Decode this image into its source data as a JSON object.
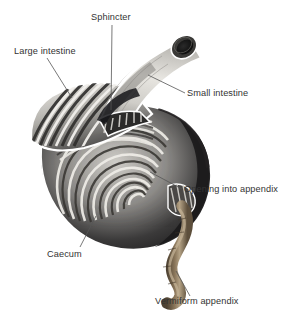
{
  "figure": {
    "background_color": "#ffffff",
    "label_color": "#333333",
    "leader_line_color": "#555555",
    "labels": [
      {
        "id": "sphincter",
        "text": "Sphincter"
      },
      {
        "id": "large_intestine",
        "text": "Large intestine"
      },
      {
        "id": "small_intestine",
        "text": "Small intestine"
      },
      {
        "id": "opening",
        "text": "Opening into appendix"
      },
      {
        "id": "caecum",
        "text": "Caecum"
      },
      {
        "id": "vermiform",
        "text": "Vermiform appendix"
      }
    ],
    "anatomy": {
      "small_intestine_tube_color": "#d9d7d2",
      "small_intestine_lumen_color": "#151515",
      "caecum_wall_dark_color": "#262426",
      "caecum_fold_light_color": "#e6e4df",
      "appendix_color": "#7b6a50",
      "appendix_highlight_color": "#b2a184",
      "outline_color": "#ffffff"
    }
  }
}
